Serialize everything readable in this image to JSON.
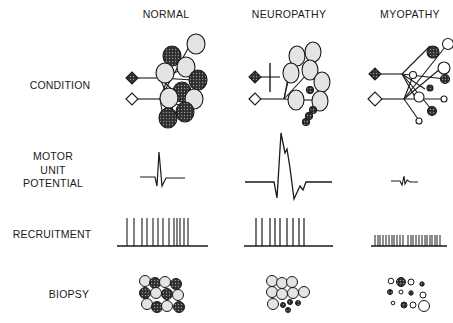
{
  "columns": [
    {
      "id": "normal",
      "label": "NORMAL"
    },
    {
      "id": "neuropathy",
      "label": "NEUROPATHY"
    },
    {
      "id": "myopathy",
      "label": "MYOPATHY"
    }
  ],
  "rows": [
    {
      "id": "condition",
      "label": "CONDITION"
    },
    {
      "id": "motor-unit-potential",
      "label_lines": [
        "MOTOR",
        "UNIT",
        "POTENTIAL"
      ]
    },
    {
      "id": "recruitment",
      "label": "RECRUITMENT"
    },
    {
      "id": "biopsy",
      "label": "BIOPSY"
    }
  ],
  "colors": {
    "line": "#1a1a1a",
    "light_fiber": "#e4e4e4",
    "dark_fiber": "#3a3a3a",
    "background": "#ffffff"
  }
}
